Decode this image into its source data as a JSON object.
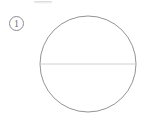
{
  "page": {
    "background_color": "#ffffff",
    "width": 145,
    "height": 122
  },
  "item_marker": {
    "label": "1",
    "glyph": "circled-digit-one",
    "text_color": "#6f6f74",
    "border_color": "#8d8d91"
  },
  "figure": {
    "name": "circle-with-diameter",
    "shapes": [
      {
        "type": "circle",
        "name": "circle-outline",
        "center_x": 50,
        "center_y": 49,
        "radius": 48,
        "stroke_color": "#86868b",
        "stroke_width": 0.9,
        "fill": "none"
      },
      {
        "type": "line",
        "name": "horizontal-diameter",
        "x1": 2,
        "y1": 49,
        "x2": 98,
        "y2": 49,
        "stroke_color": "#cbcbcf",
        "stroke_width": 0.9
      }
    ]
  },
  "artifacts": {
    "top_smudge_color": "#cdcdd2"
  }
}
